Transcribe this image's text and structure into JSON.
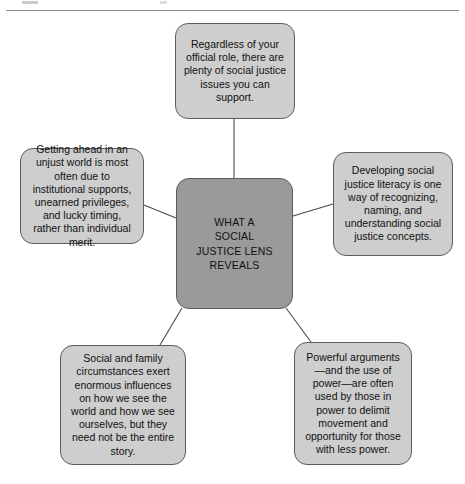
{
  "diagram": {
    "type": "radial-hub-and-spoke",
    "center": {
      "id": "center",
      "label": "WHAT A\nSOCIAL\nJUSTICE LENS\nREVEALS",
      "lines": [
        "WHAT A",
        "SOCIAL",
        "JUSTICE LENS",
        "REVEALS"
      ],
      "fill": "#9a9a9a",
      "stroke": "#5d5d5d"
    },
    "nodes": [
      {
        "id": "top",
        "position": "top",
        "text": "Regardless of your official role, there are plenty of social justice issues you can support.",
        "fill": "#cecece",
        "stroke": "#5d5d5d"
      },
      {
        "id": "left",
        "position": "left",
        "text": "Getting ahead in an unjust world is most often due to institutional supports, unearned privileges, and lucky timing, rather than individual merit.",
        "fill": "#cecece",
        "stroke": "#5d5d5d"
      },
      {
        "id": "right",
        "position": "right",
        "text": "Developing social justice literacy is one way of recognizing, naming, and understanding social justice concepts.",
        "fill": "#cecece",
        "stroke": "#5d5d5d"
      },
      {
        "id": "bottom-left",
        "position": "bottom-left",
        "text": "Social and family circumstances exert enormous influences on how we see the world and how we see ourselves, but they need not be the entire story.",
        "fill": "#cecece",
        "stroke": "#5d5d5d"
      },
      {
        "id": "bottom-right",
        "position": "bottom-right",
        "text": "Powerful arguments—and the use of power—are often used by those in power to delimit movement and opportunity for those with less power.",
        "fill": "#cecece",
        "stroke": "#5d5d5d"
      }
    ],
    "connectors": [
      {
        "from": "center",
        "to": "top"
      },
      {
        "from": "center",
        "to": "left"
      },
      {
        "from": "center",
        "to": "right"
      },
      {
        "from": "center",
        "to": "bottom-left"
      },
      {
        "from": "center",
        "to": "bottom-right"
      }
    ],
    "line_color": "#4a4a4a",
    "background": "#ffffff"
  }
}
